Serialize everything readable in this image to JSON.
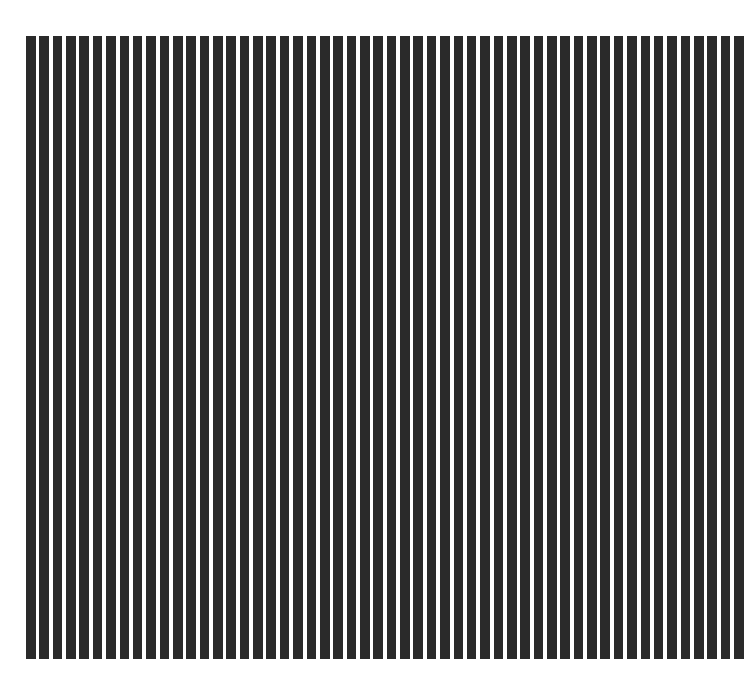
{
  "pattern": {
    "type": "vertical-stripes",
    "stripe_count": 54,
    "stripe_color": "#2a2a2a",
    "background_color": "#ffffff",
    "region": {
      "left": 26,
      "top": 36,
      "width": 718,
      "height": 623
    },
    "stripe_width": 9.6,
    "pitch": 13.3
  }
}
